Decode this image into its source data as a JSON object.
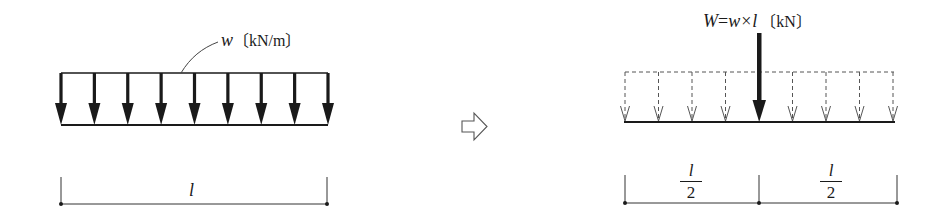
{
  "diagram": {
    "colors": {
      "ink": "#1a1a1a",
      "dashed": "#555555",
      "leader": "#444444"
    },
    "left_panel": {
      "name": "distributed-load-beam",
      "load_label": {
        "var": "w",
        "unit": "〔kN/m〕"
      },
      "arrow_count": 9,
      "span_label": "l"
    },
    "transition_icon": "hollow-right-arrow",
    "right_panel": {
      "name": "equivalent-point-load-beam",
      "load_label": {
        "lhs": "W",
        "eq": "=",
        "a": "w",
        "times": "×",
        "b": "l",
        "unit": "〔kN〕"
      },
      "dashed_arrow_count": 8,
      "point_load_position": "center",
      "half_span_left": {
        "num": "l",
        "den": "2"
      },
      "half_span_right": {
        "num": "l",
        "den": "2"
      }
    }
  }
}
